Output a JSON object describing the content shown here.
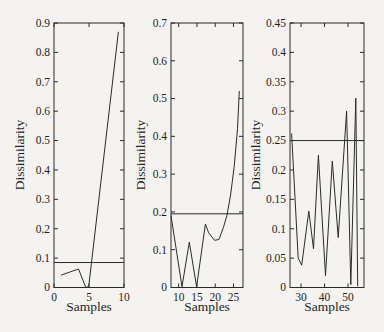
{
  "figure": {
    "background_color": "#f4f3f0",
    "line_color": "#2a2a2a",
    "text_color": "#1f1f1f"
  },
  "chart_data": [
    {
      "type": "line",
      "xlabel": "Samples",
      "ylabel": "Dissimilarity",
      "xlim": [
        0,
        10
      ],
      "ylim": [
        0,
        0.9
      ],
      "xticks": [
        0,
        5,
        10
      ],
      "xtick_labels": [
        "0",
        "5",
        "10"
      ],
      "yticks": [
        0,
        0.1,
        0.2,
        0.3,
        0.4,
        0.5,
        0.6,
        0.7,
        0.8,
        0.9
      ],
      "ytick_labels": [
        "0",
        "0.1",
        "0.2",
        "0.3",
        "0.4",
        "0.5",
        "0.6",
        "0.7",
        "0.8",
        "0.9"
      ],
      "grid": false,
      "legend": null,
      "threshold_line_y": 0.085,
      "series": [
        {
          "name": "dissimilarity-curve",
          "points": [
            [
              1,
              0.042
            ],
            [
              2.2,
              0.052
            ],
            [
              3.5,
              0.063
            ],
            [
              4.55,
              0.0
            ],
            [
              4.95,
              0.003
            ],
            [
              9.2,
              0.87
            ]
          ]
        }
      ]
    },
    {
      "type": "line",
      "xlabel": "Samples",
      "ylabel": "Dissimilarity",
      "xlim": [
        7.9,
        27.6
      ],
      "ylim": [
        0,
        0.7
      ],
      "xticks": [
        10,
        15,
        20,
        25
      ],
      "xtick_labels": [
        "10",
        "15",
        "20",
        "25"
      ],
      "yticks": [
        0,
        0.1,
        0.2,
        0.3,
        0.4,
        0.5,
        0.6,
        0.7
      ],
      "ytick_labels": [
        "0",
        "0.1",
        "0.2",
        "0.3",
        "0.4",
        "0.5",
        "0.6",
        "0.7"
      ],
      "grid": false,
      "legend": null,
      "threshold_line_y": 0.195,
      "series": [
        {
          "name": "dissimilarity-curve",
          "points": [
            [
              7.9,
              0.19
            ],
            [
              10.9,
              0.002
            ],
            [
              12.9,
              0.12
            ],
            [
              14.9,
              0.002
            ],
            [
              17.3,
              0.168
            ],
            [
              18.2,
              0.145
            ],
            [
              19.8,
              0.125
            ],
            [
              21,
              0.127
            ],
            [
              22.2,
              0.158
            ],
            [
              23.2,
              0.19
            ],
            [
              24.2,
              0.245
            ],
            [
              25.2,
              0.32
            ],
            [
              26.1,
              0.42
            ],
            [
              26.6,
              0.52
            ]
          ]
        }
      ]
    },
    {
      "type": "line",
      "xlabel": "Samples",
      "ylabel": "Dissimilarity",
      "xlim": [
        25.3,
        56.8
      ],
      "ylim": [
        0,
        0.45
      ],
      "xticks": [
        30,
        40,
        50
      ],
      "xtick_labels": [
        "30",
        "40",
        "50"
      ],
      "yticks": [
        0,
        0.05,
        0.1,
        0.15,
        0.2,
        0.25,
        0.3,
        0.35,
        0.4,
        0.45
      ],
      "ytick_labels": [
        "0",
        "0.05",
        "0.1",
        "0.15",
        "0.2",
        "0.25",
        "0.3",
        "0.35",
        "0.4",
        "0.45"
      ],
      "grid": false,
      "legend": null,
      "threshold_line_y": 0.25,
      "series": [
        {
          "name": "dissimilarity-curve",
          "points": [
            [
              26,
              0.262
            ],
            [
              28.8,
              0.05
            ],
            [
              30.3,
              0.038
            ],
            [
              33.3,
              0.13
            ],
            [
              35.3,
              0.066
            ],
            [
              37.4,
              0.225
            ],
            [
              40.4,
              0.02
            ],
            [
              43.3,
              0.215
            ],
            [
              45.8,
              0.085
            ],
            [
              49.4,
              0.3
            ],
            [
              51.2,
              0.005
            ],
            [
              53.3,
              0.322
            ],
            [
              54.1,
              0.002
            ]
          ]
        }
      ]
    }
  ]
}
